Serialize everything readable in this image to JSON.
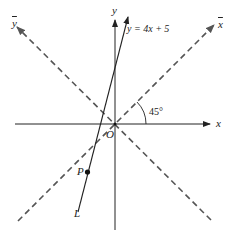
{
  "labels": {
    "y_axis": "y",
    "x_axis": "x",
    "x_bar": "x",
    "y_bar": "y",
    "origin": "O",
    "line_equation": "y = 4x + 5",
    "line_name": "L",
    "point": "P",
    "angle": "45°"
  },
  "colors": {
    "axis": "#222222",
    "dashed": "#555555",
    "background": "#ffffff"
  }
}
